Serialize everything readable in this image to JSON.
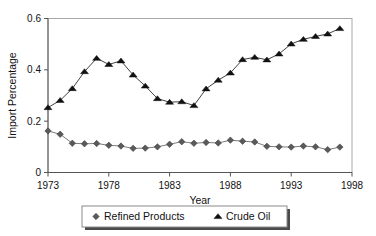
{
  "chart_data": {
    "type": "line",
    "title": "",
    "xlabel": "Year",
    "ylabel": "Import Percentage",
    "xlim": [
      1973,
      1998
    ],
    "ylim": [
      0,
      0.6
    ],
    "grid": false,
    "legend_position": "bottom",
    "x_ticks": [
      "1973",
      "1978",
      "1983",
      "1988",
      "1993",
      "1998"
    ],
    "x_tick_values": [
      1973,
      1978,
      1983,
      1988,
      1993,
      1998
    ],
    "y_ticks": [
      "0",
      "0.2",
      "0.4",
      "0.6"
    ],
    "y_tick_values": [
      0,
      0.2,
      0.4,
      0.6
    ],
    "x": [
      1973,
      1974,
      1975,
      1976,
      1977,
      1978,
      1979,
      1980,
      1981,
      1982,
      1983,
      1984,
      1985,
      1986,
      1987,
      1988,
      1989,
      1990,
      1991,
      1992,
      1993,
      1994,
      1995,
      1996,
      1997
    ],
    "series": [
      {
        "name": "Refined Products",
        "marker": "diamond",
        "color": "#5a5a5a",
        "values": [
          0.162,
          0.149,
          0.114,
          0.112,
          0.113,
          0.106,
          0.103,
          0.094,
          0.095,
          0.1,
          0.11,
          0.12,
          0.114,
          0.117,
          0.115,
          0.126,
          0.122,
          0.119,
          0.102,
          0.1,
          0.099,
          0.103,
          0.1,
          0.089,
          0.099
        ]
      },
      {
        "name": "Crude Oil",
        "marker": "triangle",
        "color": "#111111",
        "values": [
          0.253,
          0.281,
          0.327,
          0.393,
          0.445,
          0.421,
          0.435,
          0.38,
          0.337,
          0.288,
          0.274,
          0.276,
          0.261,
          0.326,
          0.36,
          0.388,
          0.44,
          0.449,
          0.439,
          0.462,
          0.501,
          0.519,
          0.53,
          0.54,
          0.561
        ]
      }
    ]
  },
  "legend": {
    "items": [
      {
        "label": "Refined Products",
        "marker": "diamond"
      },
      {
        "label": "Crude Oil",
        "marker": "triangle"
      }
    ]
  }
}
